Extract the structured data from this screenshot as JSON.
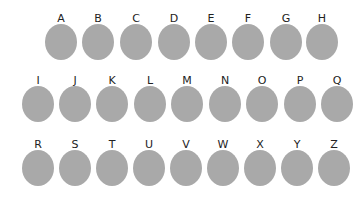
{
  "circle_color": "#a9a9a9",
  "rows": [
    {
      "top": 13,
      "items": [
        {
          "label": "A",
          "x": 61
        },
        {
          "label": "B",
          "x": 98
        },
        {
          "label": "C",
          "x": 136
        },
        {
          "label": "D",
          "x": 174
        },
        {
          "label": "E",
          "x": 211
        },
        {
          "label": "F",
          "x": 248
        },
        {
          "label": "G",
          "x": 286
        },
        {
          "label": "H",
          "x": 322
        }
      ]
    },
    {
      "top": 75,
      "items": [
        {
          "label": "I",
          "x": 38
        },
        {
          "label": "J",
          "x": 75
        },
        {
          "label": "K",
          "x": 112
        },
        {
          "label": "L",
          "x": 150
        },
        {
          "label": "M",
          "x": 187
        },
        {
          "label": "N",
          "x": 225
        },
        {
          "label": "O",
          "x": 262
        },
        {
          "label": "P",
          "x": 300
        },
        {
          "label": "Q",
          "x": 337
        }
      ]
    },
    {
      "top": 139,
      "items": [
        {
          "label": "R",
          "x": 38
        },
        {
          "label": "S",
          "x": 75
        },
        {
          "label": "T",
          "x": 112
        },
        {
          "label": "U",
          "x": 149
        },
        {
          "label": "V",
          "x": 186
        },
        {
          "label": "W",
          "x": 223
        },
        {
          "label": "X",
          "x": 260
        },
        {
          "label": "Y",
          "x": 297
        },
        {
          "label": "Z",
          "x": 334
        }
      ]
    }
  ]
}
